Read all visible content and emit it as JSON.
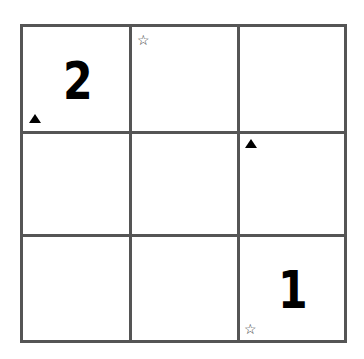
{
  "puzzle": {
    "rows": 3,
    "cols": 3,
    "line_color": "#555555",
    "cells": [
      {
        "row": 0,
        "col": 0,
        "value": "2",
        "marker": "triangle-up",
        "marker_position": "bottom-left"
      },
      {
        "row": 0,
        "col": 1,
        "value": "",
        "marker": "star-outline",
        "marker_position": "top-left"
      },
      {
        "row": 0,
        "col": 2,
        "value": "",
        "marker": "",
        "marker_position": ""
      },
      {
        "row": 1,
        "col": 0,
        "value": "",
        "marker": "",
        "marker_position": ""
      },
      {
        "row": 1,
        "col": 1,
        "value": "",
        "marker": "",
        "marker_position": ""
      },
      {
        "row": 1,
        "col": 2,
        "value": "",
        "marker": "triangle-up",
        "marker_position": "top-left"
      },
      {
        "row": 2,
        "col": 0,
        "value": "",
        "marker": "",
        "marker_position": ""
      },
      {
        "row": 2,
        "col": 1,
        "value": "",
        "marker": "",
        "marker_position": ""
      },
      {
        "row": 2,
        "col": 2,
        "value": "1",
        "marker": "star-outline",
        "marker_position": "bottom-left"
      }
    ],
    "glyphs": {
      "star": "☆"
    }
  }
}
